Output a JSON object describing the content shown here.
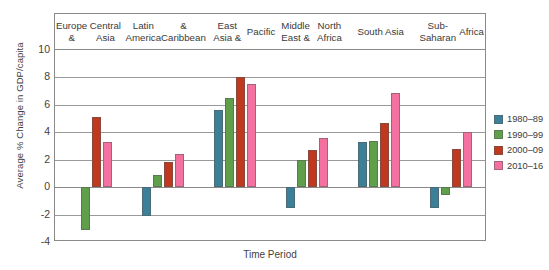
{
  "chart_data": {
    "type": "bar",
    "title": "",
    "xlabel": "Time Period",
    "ylabel": "Average % Change in GDP/capita",
    "ylim": [
      -4,
      10
    ],
    "yticks": [
      10,
      8,
      6,
      4,
      2,
      0,
      -2,
      -4
    ],
    "ytick_labels": [
      "10",
      "8",
      "6",
      "4",
      "2",
      "0",
      "-2",
      "-4"
    ],
    "grid": true,
    "legend_position": "right",
    "categories": [
      "Europe &\nCentral Asia",
      "Latin America\n& Caribbean",
      "East Asia &\nPacific",
      "Middle East &\nNorth Africa",
      "South Asia",
      "Sub-Saharan\nAfrica"
    ],
    "series": [
      {
        "name": "1980–89",
        "color": "#3c7f99",
        "values": [
          null,
          -2.1,
          5.6,
          -1.5,
          3.3,
          -1.5
        ]
      },
      {
        "name": "1990–99",
        "color": "#5f9e4b",
        "values": [
          -3.1,
          0.9,
          6.5,
          2.0,
          3.35,
          -0.6
        ]
      },
      {
        "name": "2000–09",
        "color": "#c0391f",
        "values": [
          5.1,
          1.8,
          8.0,
          2.7,
          4.7,
          2.8
        ]
      },
      {
        "name": "2010–16",
        "color": "#f4719f",
        "values": [
          3.3,
          2.4,
          7.5,
          3.6,
          6.9,
          4.0
        ]
      }
    ]
  },
  "axis": {
    "y_title": "Average % Change in GDP/capita",
    "x_title": "Time Period"
  },
  "groups": [
    {
      "line1": "Europe &",
      "line2": "Central Asia"
    },
    {
      "line1": "Latin America",
      "line2": "& Caribbean"
    },
    {
      "line1": "East Asia &",
      "line2": "Pacific"
    },
    {
      "line1": "Middle East &",
      "line2": "North Africa"
    },
    {
      "line1": "South Asia",
      "line2": ""
    },
    {
      "line1": "Sub-Saharan",
      "line2": "Africa"
    }
  ],
  "legend": {
    "items": [
      {
        "label": "1980–89",
        "color": "#3c7f99"
      },
      {
        "label": "1990–99",
        "color": "#5f9e4b"
      },
      {
        "label": "2000–09",
        "color": "#c0391f"
      },
      {
        "label": "2010–16",
        "color": "#f4719f"
      }
    ]
  }
}
